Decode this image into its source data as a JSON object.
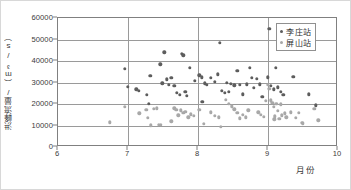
{
  "chart_data": {
    "type": "scatter",
    "title": "",
    "xlabel": "月份",
    "ylabel": "洪峰流量/（m³/s）",
    "xlim": [
      6,
      10
    ],
    "ylim": [
      0,
      60000
    ],
    "xticks": [
      6,
      7,
      8,
      9,
      10
    ],
    "yticks": [
      0,
      10000,
      20000,
      30000,
      40000,
      50000,
      60000
    ],
    "xtick_labels": [
      "6",
      "7",
      "8",
      "9",
      "10"
    ],
    "ytick_labels": [
      "0",
      "10000",
      "20000",
      "30000",
      "40000",
      "50000",
      "60000"
    ],
    "grid": "horizontal-and-vertical",
    "legend_position": "top-right",
    "series": [
      {
        "name": "李庄站",
        "color": "#5d5d5d",
        "points": [
          [
            6.95,
            36500
          ],
          [
            7.0,
            28000
          ],
          [
            7.12,
            26800
          ],
          [
            7.15,
            26100
          ],
          [
            7.27,
            24400
          ],
          [
            7.3,
            20000
          ],
          [
            7.32,
            33000
          ],
          [
            7.46,
            38400
          ],
          [
            7.49,
            29700
          ],
          [
            7.52,
            44000
          ],
          [
            7.55,
            31400
          ],
          [
            7.58,
            29000
          ],
          [
            7.62,
            32200
          ],
          [
            7.66,
            28600
          ],
          [
            7.7,
            25100
          ],
          [
            7.74,
            24200
          ],
          [
            7.77,
            43400
          ],
          [
            7.79,
            42600
          ],
          [
            7.82,
            25600
          ],
          [
            7.84,
            23900
          ],
          [
            7.88,
            36700
          ],
          [
            7.95,
            30800
          ],
          [
            8.02,
            33300
          ],
          [
            8.05,
            32400
          ],
          [
            8.06,
            21100
          ],
          [
            8.1,
            29600
          ],
          [
            8.13,
            28800
          ],
          [
            8.18,
            32200
          ],
          [
            8.24,
            30200
          ],
          [
            8.28,
            33900
          ],
          [
            8.31,
            48500
          ],
          [
            8.34,
            26100
          ],
          [
            8.38,
            25100
          ],
          [
            8.41,
            30000
          ],
          [
            8.44,
            25600
          ],
          [
            8.47,
            29400
          ],
          [
            8.52,
            28700
          ],
          [
            8.56,
            35300
          ],
          [
            8.6,
            28800
          ],
          [
            8.64,
            24500
          ],
          [
            8.7,
            29200
          ],
          [
            8.74,
            36700
          ],
          [
            8.77,
            32100
          ],
          [
            8.8,
            27400
          ],
          [
            8.84,
            31600
          ],
          [
            8.88,
            29100
          ],
          [
            8.92,
            23300
          ],
          [
            9.0,
            32500
          ],
          [
            9.02,
            55100
          ],
          [
            9.04,
            28600
          ],
          [
            9.08,
            26900
          ],
          [
            9.11,
            36700
          ],
          [
            9.14,
            27800
          ],
          [
            9.18,
            25700
          ],
          [
            9.22,
            24400
          ],
          [
            9.36,
            32700
          ],
          [
            9.58,
            24500
          ],
          [
            9.68,
            19400
          ]
        ]
      },
      {
        "name": "屏山站",
        "color": "#a8a8a8",
        "points": [
          [
            6.74,
            11400
          ],
          [
            6.95,
            18600
          ],
          [
            7.16,
            15600
          ],
          [
            7.26,
            17300
          ],
          [
            7.28,
            13600
          ],
          [
            7.33,
            10100
          ],
          [
            7.37,
            17900
          ],
          [
            7.41,
            18000
          ],
          [
            7.44,
            10200
          ],
          [
            7.47,
            10400
          ],
          [
            7.62,
            11900
          ],
          [
            7.66,
            18000
          ],
          [
            7.69,
            17400
          ],
          [
            7.72,
            14700
          ],
          [
            7.75,
            17100
          ],
          [
            7.79,
            15900
          ],
          [
            7.82,
            16300
          ],
          [
            7.86,
            13900
          ],
          [
            7.9,
            15200
          ],
          [
            7.94,
            14600
          ],
          [
            8.02,
            17400
          ],
          [
            8.08,
            10800
          ],
          [
            8.18,
            16200
          ],
          [
            8.24,
            14400
          ],
          [
            8.3,
            13900
          ],
          [
            8.33,
            9400
          ],
          [
            8.4,
            21900
          ],
          [
            8.44,
            20100
          ],
          [
            8.48,
            19000
          ],
          [
            8.52,
            17500
          ],
          [
            8.56,
            16000
          ],
          [
            8.6,
            13400
          ],
          [
            8.64,
            14900
          ],
          [
            8.68,
            13900
          ],
          [
            8.72,
            17100
          ],
          [
            8.86,
            16100
          ],
          [
            8.9,
            15100
          ],
          [
            8.94,
            14100
          ],
          [
            8.97,
            21400
          ],
          [
            9.0,
            28800
          ],
          [
            9.02,
            27100
          ],
          [
            9.04,
            21700
          ],
          [
            9.06,
            20500
          ],
          [
            9.08,
            18800
          ],
          [
            9.09,
            12900
          ],
          [
            9.1,
            14200
          ],
          [
            9.12,
            20100
          ],
          [
            9.14,
            16900
          ],
          [
            9.16,
            13100
          ],
          [
            9.18,
            19800
          ],
          [
            9.2,
            14700
          ],
          [
            9.24,
            15700
          ],
          [
            9.26,
            13800
          ],
          [
            9.33,
            16100
          ],
          [
            9.4,
            13600
          ],
          [
            9.44,
            15900
          ],
          [
            9.48,
            11300
          ],
          [
            9.5,
            11000
          ],
          [
            9.66,
            17900
          ],
          [
            9.72,
            12500
          ]
        ]
      }
    ]
  },
  "legend": {
    "items": [
      {
        "label": "李庄站",
        "color": "#5d5d5d"
      },
      {
        "label": "屏山站",
        "color": "#a8a8a8"
      }
    ]
  },
  "axes": {
    "x_title": "月份",
    "y_title": "洪峰流量/（m³/s）"
  }
}
